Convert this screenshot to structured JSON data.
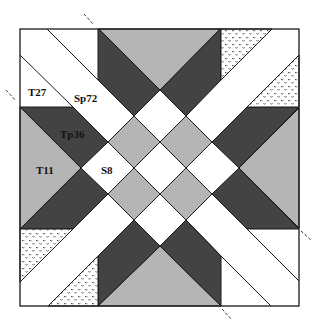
{
  "diagram": {
    "title": "",
    "type": "quilt block pattern",
    "colors": {
      "background": "#ffffff",
      "light_gray": "#b5b5b5",
      "dark_gray": "#434343",
      "outline": "#1a1a1a",
      "dotted_fill": "#ffffff",
      "dot_color": "#2a2a2a"
    },
    "labels": [
      {
        "id": "T27",
        "text": "T27",
        "x": 28,
        "y": 96
      },
      {
        "id": "Sp72",
        "text": "Sp72",
        "x": 74,
        "y": 102
      },
      {
        "id": "Tp36",
        "text": "Tp36",
        "x": 60,
        "y": 138
      },
      {
        "id": "T11",
        "text": "T11",
        "x": 36,
        "y": 174
      },
      {
        "id": "S8",
        "text": "S8",
        "x": 101,
        "y": 174
      }
    ],
    "cut_marks": [
      {
        "position": "top",
        "x1": 84,
        "y1": 14,
        "x2": 94,
        "y2": 25
      },
      {
        "position": "left",
        "x1": 6,
        "y1": 90,
        "x2": 16,
        "y2": 101
      },
      {
        "position": "right",
        "x1": 301,
        "y1": 231,
        "x2": 312,
        "y2": 241
      },
      {
        "position": "bottom",
        "x1": 222,
        "y1": 309,
        "x2": 232,
        "y2": 320
      }
    ]
  }
}
